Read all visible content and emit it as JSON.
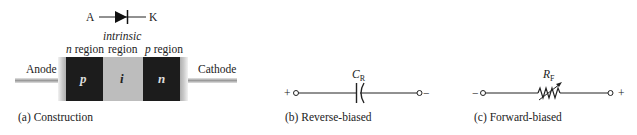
{
  "symbol": {
    "anode_label": "A",
    "cathode_label": "K"
  },
  "construction": {
    "region_labels": {
      "left": {
        "prefix": "n",
        "text": " region"
      },
      "middle_top": "intrinsic",
      "middle": "region",
      "right": {
        "prefix": "p",
        "text": " region"
      }
    },
    "anode_label": "Anode",
    "cathode_label": "Cathode",
    "blocks": [
      {
        "label": "p",
        "color": "#1c1c1c"
      },
      {
        "label": "i",
        "color": "#bdbdbd"
      },
      {
        "label": "n",
        "color": "#1c1c1c"
      }
    ],
    "caption": "(a) Construction"
  },
  "reverse": {
    "component_label": "C",
    "component_subscript": "R",
    "left_terminal": "+",
    "right_terminal": "−",
    "caption": "(b) Reverse-biased"
  },
  "forward": {
    "component_label": "R",
    "component_subscript": "F",
    "left_terminal": "−",
    "right_terminal": "+",
    "caption": "(c) Forward-biased"
  }
}
